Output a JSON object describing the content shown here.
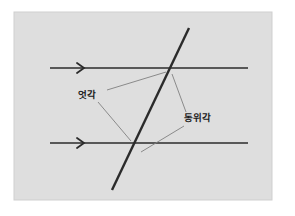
{
  "figure": {
    "kind": "geometry-diagram",
    "topic": "parallel-lines-cut-by-transversal",
    "canvas": {
      "width": 295,
      "height": 216
    },
    "panel": {
      "name": "diagram-panel",
      "x": 14,
      "y": 12,
      "width": 258,
      "height": 188,
      "fill": "#dedede",
      "border_color": "#cfcfcf"
    },
    "background_color": "#ffffff",
    "line_color": "#2b2b2b",
    "leader_color": "#808080",
    "parallel_lines": [
      {
        "name": "upper-parallel-line",
        "x1": 50,
        "y1": 68,
        "x2": 248,
        "y2": 68,
        "stroke_width": 1.6,
        "marker": "chevron-right",
        "marker_x": 84
      },
      {
        "name": "lower-parallel-line",
        "x1": 50,
        "y1": 143,
        "x2": 248,
        "y2": 143,
        "stroke_width": 1.6,
        "marker": "chevron-right",
        "marker_x": 84
      }
    ],
    "transversal": {
      "name": "transversal-line",
      "x1": 112,
      "y1": 190,
      "x2": 189,
      "y2": 28,
      "stroke_width": 2.4
    },
    "intersections": [
      {
        "name": "upper-intersection",
        "x": 168,
        "y": 68
      },
      {
        "name": "lower-intersection",
        "x": 129,
        "y": 143
      }
    ],
    "labels": [
      {
        "name": "alternate-angles-label",
        "text": "엇각",
        "x": 78,
        "y": 98,
        "anchor": "start",
        "meaning": "alternate angles"
      },
      {
        "name": "corresponding-angles-label",
        "text": "동위각",
        "x": 184,
        "y": 121,
        "anchor": "start",
        "meaning": "corresponding angles"
      }
    ],
    "leader_lines": [
      {
        "name": "leader-alternate-to-upper-intersection",
        "from_label": "엇각",
        "x1": 107,
        "y1": 90,
        "x2": 166,
        "y2": 72
      },
      {
        "name": "leader-alternate-to-lower-intersection",
        "from_label": "엇각",
        "x1": 98,
        "y1": 102,
        "x2": 131,
        "y2": 141
      },
      {
        "name": "leader-corresponding-to-upper-intersection",
        "from_label": "동위각",
        "x1": 186,
        "y1": 112,
        "x2": 172,
        "y2": 74
      },
      {
        "name": "leader-corresponding-to-lower-region",
        "from_label": "동위각",
        "x1": 184,
        "y1": 126,
        "x2": 141,
        "y2": 152
      }
    ]
  }
}
